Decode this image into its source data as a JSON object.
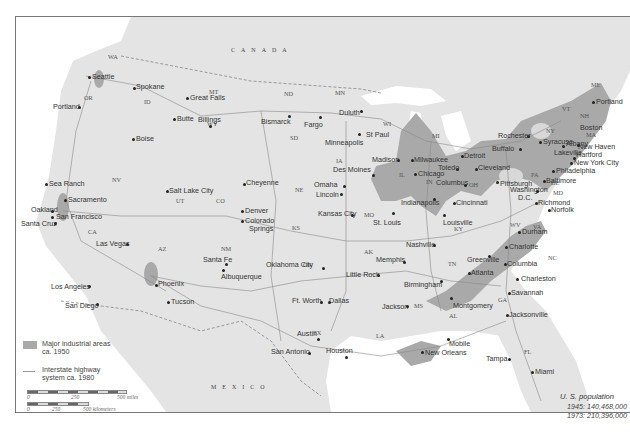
{
  "map": {
    "countries": [
      {
        "label": "CANADA",
        "letters": [
          "C",
          "A",
          "N",
          "A",
          "D",
          "A"
        ]
      },
      {
        "label": "MEXICO"
      }
    ],
    "colors": {
      "land": "#e4e4e4",
      "water": "#ffffff",
      "industrial": "#a9a9a9",
      "highway": "#8a8a8a",
      "border": "#777777"
    },
    "states": [
      "WA",
      "OR",
      "ID",
      "MT",
      "WY",
      "NV",
      "UT",
      "CO",
      "AZ",
      "NM",
      "CA",
      "ND",
      "SD",
      "NE",
      "KS",
      "OK",
      "TX",
      "MN",
      "IA",
      "MO",
      "AR",
      "LA",
      "WI",
      "IL",
      "MI",
      "IN",
      "OH",
      "KY",
      "TN",
      "MS",
      "AL",
      "GA",
      "FL",
      "SC",
      "NC",
      "VA",
      "WV",
      "PA",
      "NY",
      "VT",
      "NH",
      "ME",
      "MA",
      "MD",
      "DE",
      "DC"
    ],
    "cities": [
      "Seattle",
      "Spokane",
      "Portland",
      "Great Falls",
      "Butte",
      "Billings",
      "Boise",
      "Bismarck",
      "Fargo",
      "Duluth",
      "Minneapolis",
      "St Paul",
      "Sea Ranch",
      "Sacramento",
      "Oakland",
      "San Francisco",
      "Santa Cruz",
      "Salt Lake City",
      "Cheyenne",
      "Denver",
      "Colorado Springs",
      "Las Vegas",
      "Los Angeles",
      "San Diego",
      "Phoenix",
      "Tucson",
      "Santa Fe",
      "Albuquerque",
      "Omaha",
      "Lincoln",
      "Des Moines",
      "Kansas City",
      "Oklahoma City",
      "Ft. Worth",
      "Dallas",
      "Austin",
      "San Antonio",
      "Houston",
      "Madison",
      "Milwaukee",
      "Chicago",
      "Detroit",
      "Toledo",
      "Cleveland",
      "Columbus",
      "Indianapolis",
      "Cincinnati",
      "St. Louis",
      "Louisville",
      "Nashville",
      "Memphis",
      "Little Rock",
      "Jackson",
      "Birmingham",
      "Montgomery",
      "Mobile",
      "New Orleans",
      "Atlanta",
      "Greenville",
      "Charlotte",
      "Columbia",
      "Charleston",
      "Savannah",
      "Jacksonville",
      "Tampa",
      "Miami",
      "Durham",
      "Richmond",
      "Norfolk",
      "Washington D.C.",
      "Baltimore",
      "Philadelphia",
      "Pittsburgh",
      "Buffalo",
      "Rochester",
      "Syracuse",
      "Albany",
      "Lakeville",
      "New Haven",
      "New York City",
      "Boston",
      "Portland",
      "Hartford"
    ]
  },
  "legend": {
    "industrial_label_line1": "Major industrial areas",
    "industrial_label_line2": "ca. 1950",
    "highway_label_line1": "Interstate highway",
    "highway_label_line2": "system ca. 1980",
    "scale_miles": {
      "start": "0",
      "mid": "250",
      "end": "500 miles"
    },
    "scale_km": {
      "start": "0",
      "mid": "250",
      "end": "500 kilometers"
    }
  },
  "population": {
    "title": "U. S. population",
    "line1": "1945: 140,468,000",
    "line2": "1973: 210,396,000"
  },
  "labels": {
    "states": {
      "WA": "WA",
      "OR": "OR",
      "ID": "ID",
      "MT": "MT",
      "WY": "WY",
      "NV": "NV",
      "UT": "UT",
      "CO": "CO",
      "AZ": "AZ",
      "NM": "NM",
      "CA": "CA",
      "ND": "ND",
      "SD": "SD",
      "NE": "NE",
      "KS": "KS",
      "OK": "OK",
      "TX": "TX",
      "MN": "MN",
      "IA": "IA",
      "MO": "MO",
      "AR": "AK",
      "LA": "LA",
      "WI": "WI",
      "IL": "IL",
      "MI": "MI",
      "IN": "IN",
      "OH": "OH",
      "KY": "KY",
      "TN": "TN",
      "MS": "MS",
      "AL": "AL",
      "GA": "GA",
      "FL": "FL",
      "NC": "NC",
      "VA": "VA",
      "WV": "WV",
      "PA": "PA",
      "NY": "NY",
      "VT": "VT",
      "NH": "NH",
      "ME": "ME",
      "MA": "MA",
      "MD": "MD",
      "DE": "DE"
    },
    "cities": {
      "seattle": "Seattle",
      "spokane": "Spokane",
      "portland_or": "Portland",
      "great_falls": "Great Falls",
      "butte": "Butte",
      "billings": "Billings",
      "boise": "Boise",
      "bismarck": "Bismarck",
      "fargo": "Fargo",
      "duluth": "Duluth",
      "minneapolis": "Minneapolis",
      "st_paul": "St Paul",
      "sea_ranch": "Sea Ranch",
      "sacramento": "Sacramento",
      "oakland": "Oakland",
      "san_francisco": "San Francisco",
      "santa_cruz": "Santa Cruz",
      "salt_lake": "Salt Lake City",
      "cheyenne": "Cheyenne",
      "denver": "Denver",
      "colorado_springs_1": "Colorado",
      "colorado_springs_2": "Springs",
      "las_vegas": "Las Vegas",
      "los_angeles": "Los Angeles",
      "san_diego": "San Diego",
      "phoenix": "Phoenix",
      "tucson": "Tucson",
      "santa_fe": "Santa Fe",
      "albuquerque": "Albuquerque",
      "omaha": "Omaha",
      "lincoln": "Lincoln",
      "des_moines": "Des Moines",
      "kansas_city": "Kansas City",
      "oklahoma_city": "Oklahoma City",
      "ft_worth": "Ft. Worth",
      "dallas": "Dallas",
      "austin": "Austin",
      "san_antonio": "San Antonio",
      "houston": "Houston",
      "madison": "Madison",
      "milwaukee": "Milwaukee",
      "chicago": "Chicago",
      "detroit": "Detroit",
      "toledo": "Toledo",
      "cleveland": "Cleveland",
      "columbus": "Columbus",
      "indianapolis": "Indianapolis",
      "cincinnati": "Cincinnati",
      "st_louis": "St. Louis",
      "louisville": "Louisville",
      "nashville": "Nashville",
      "memphis": "Memphis",
      "little_rock": "Little Rock",
      "jackson": "Jackson",
      "birmingham": "Birmingham",
      "montgomery": "Montgomery",
      "mobile": "Mobile",
      "new_orleans": "New Orleans",
      "atlanta": "Atlanta",
      "greenville": "Greenville",
      "charlotte": "Charlotte",
      "columbia": "Columbia",
      "charleston": "Charleston",
      "savannah": "Savannah",
      "jacksonville": "Jacksonville",
      "tampa": "Tampa",
      "miami": "Miami",
      "durham": "Durham",
      "richmond": "Richmond",
      "norfolk": "Norfolk",
      "washington_1": "Washington",
      "washington_2": "D.C.",
      "baltimore": "Baltimore",
      "philadelphia": "Philadelphia",
      "pittsburgh": "Pittsburgh",
      "buffalo": "Buffalo",
      "rochester": "Rochester",
      "syracuse": "Syracuse",
      "albany": "Albany",
      "lakeville": "Lakeville",
      "new_haven": "New Haven",
      "new_york": "New York City",
      "boston": "Boston",
      "portland_me": "Portland",
      "hartford": "Hartford"
    },
    "mexico": "MEXICO"
  }
}
